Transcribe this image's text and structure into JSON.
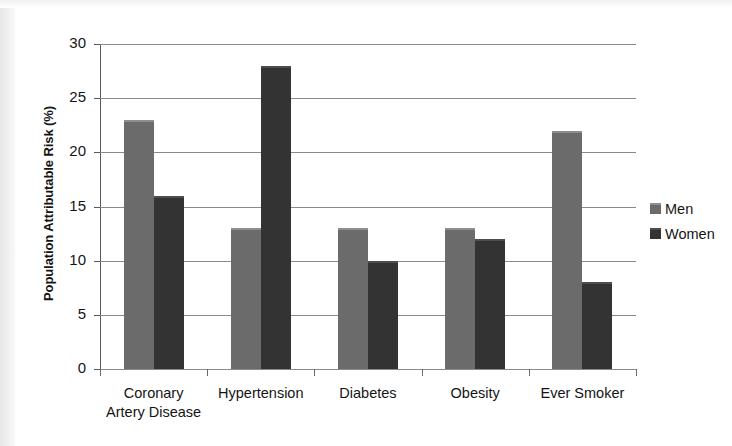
{
  "chart_data": {
    "type": "bar",
    "title": "",
    "xlabel": "",
    "ylabel": "Population Attributable Risk (%)",
    "ylim": [
      0,
      30
    ],
    "yticks": [
      0,
      5,
      10,
      15,
      20,
      25,
      30
    ],
    "grid": true,
    "legend_position": "right",
    "categories": [
      "Coronary Artery Disease",
      "Hypertension",
      "Diabetes",
      "Obesity",
      "Ever Smoker"
    ],
    "category_label_lines": [
      [
        "Coronary",
        "Artery Disease"
      ],
      [
        "Hypertension"
      ],
      [
        "Diabetes"
      ],
      [
        "Obesity"
      ],
      [
        "Ever Smoker"
      ]
    ],
    "series": [
      {
        "name": "Men",
        "color": "#6b6b6b",
        "values": [
          23,
          13,
          13,
          13,
          22
        ]
      },
      {
        "name": "Women",
        "color": "#333333",
        "values": [
          16,
          28,
          10,
          12,
          8
        ]
      }
    ]
  }
}
